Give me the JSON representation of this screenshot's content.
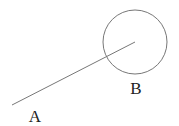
{
  "diagram": {
    "points": [
      {
        "id": "A",
        "label": "A",
        "x": 12,
        "y": 105,
        "label_x": 35,
        "label_y": 122
      },
      {
        "id": "B",
        "label": "B",
        "x": 135,
        "y": 42,
        "label_x": 136,
        "label_y": 94
      }
    ],
    "segment": {
      "from": "A",
      "to": "B"
    },
    "circle": {
      "center": "B",
      "radius": 32
    },
    "colors": {
      "stroke": "#777777",
      "text": "#222222",
      "background": "#ffffff"
    }
  }
}
